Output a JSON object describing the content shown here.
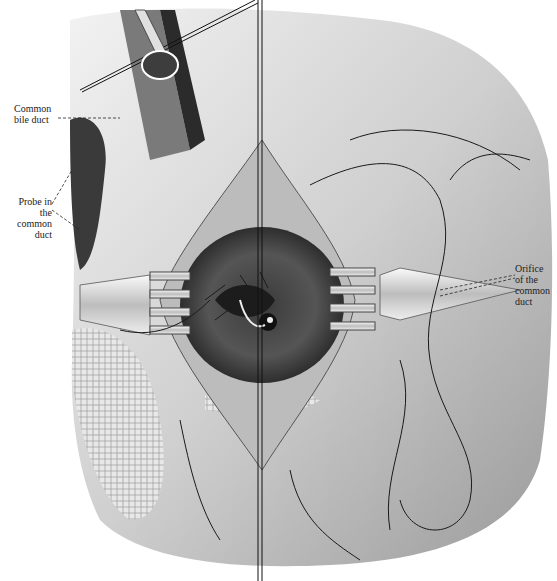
{
  "figure": {
    "labels": [
      {
        "id": "common-bile-duct",
        "lines": [
          "Common",
          "bile duct"
        ]
      },
      {
        "id": "probe-in-common-duct",
        "lines": [
          "Probe in",
          "the common",
          "duct"
        ]
      },
      {
        "id": "orifice-of-common-duct",
        "lines": [
          "Orifice",
          "of the",
          "common",
          "duct"
        ]
      }
    ]
  },
  "colors": {
    "background": "#ffffff",
    "tissue_light": "#d9d9d9",
    "tissue_mid": "#8c8c8c",
    "tissue_dark": "#2a2a2a",
    "ink": "#111111"
  }
}
